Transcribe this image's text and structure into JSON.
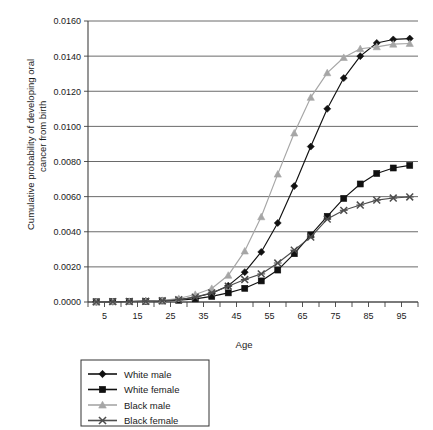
{
  "chart_data": {
    "type": "line",
    "title": "",
    "xlabel": "Age",
    "ylabel": "Cumulative probability of developing oral cancer from birth",
    "ylabel_line1": "Cumulative probability of developing oral",
    "ylabel_line2": "cancer from birth",
    "grid": true,
    "legend_position": "below-left",
    "xlim": [
      0,
      100
    ],
    "ylim": [
      0.0,
      0.016
    ],
    "xticks": [
      5,
      15,
      25,
      35,
      45,
      55,
      65,
      75,
      85,
      95
    ],
    "xtick_labels": [
      "5",
      "15",
      "25",
      "35",
      "45",
      "55",
      "65",
      "75",
      "85",
      "95"
    ],
    "xminor_ticks": [
      0,
      10,
      20,
      30,
      40,
      50,
      60,
      70,
      80,
      90,
      100
    ],
    "yticks": [
      0.0,
      0.002,
      0.004,
      0.006,
      0.008,
      0.01,
      0.012,
      0.014,
      0.016
    ],
    "ytick_labels": [
      "0.0000",
      "0.0020",
      "0.0040",
      "0.0060",
      "0.0080",
      "0.0100",
      "0.0120",
      "0.0140",
      "0.0160"
    ],
    "x": [
      2.5,
      7.5,
      12.5,
      17.5,
      22.5,
      27.5,
      32.5,
      37.5,
      42.5,
      47.5,
      52.5,
      57.5,
      62.5,
      67.5,
      72.5,
      77.5,
      82.5,
      87.5,
      92.5,
      97.5
    ],
    "series": [
      {
        "name": "White male",
        "marker": "diamond",
        "color": "#111111",
        "values": [
          1e-05,
          2e-05,
          3e-05,
          5e-05,
          8e-05,
          0.00014,
          0.00027,
          0.0005,
          0.00093,
          0.0017,
          0.00285,
          0.0045,
          0.0066,
          0.00885,
          0.011,
          0.01275,
          0.014,
          0.01475,
          0.01495,
          0.015
        ]
      },
      {
        "name": "White female",
        "marker": "square",
        "color": "#111111",
        "values": [
          1e-05,
          2e-05,
          3e-05,
          4e-05,
          6e-05,
          0.0001,
          0.00018,
          0.00032,
          0.00052,
          0.00078,
          0.0012,
          0.00182,
          0.00275,
          0.00382,
          0.00488,
          0.0059,
          0.00672,
          0.00732,
          0.00763,
          0.00778
        ]
      },
      {
        "name": "Black male",
        "marker": "triangle",
        "color": "#a6a6a6",
        "values": [
          1e-05,
          2e-05,
          3e-05,
          5e-05,
          9e-05,
          0.0002,
          0.00043,
          0.00077,
          0.00152,
          0.0029,
          0.00485,
          0.00728,
          0.00962,
          0.01165,
          0.01305,
          0.01392,
          0.01442,
          0.01453,
          0.01468,
          0.01472
        ]
      },
      {
        "name": "Black female",
        "marker": "x",
        "color": "#4d4d4d",
        "values": [
          1e-05,
          2e-05,
          3e-05,
          4e-05,
          7e-05,
          0.00013,
          0.00028,
          0.00052,
          0.0009,
          0.00128,
          0.0016,
          0.00222,
          0.00295,
          0.0037,
          0.00472,
          0.00522,
          0.00552,
          0.0058,
          0.00592,
          0.00598
        ]
      }
    ]
  },
  "legend": {
    "items": [
      {
        "label": "White male"
      },
      {
        "label": "White female"
      },
      {
        "label": "Black male"
      },
      {
        "label": "Black female"
      }
    ]
  }
}
